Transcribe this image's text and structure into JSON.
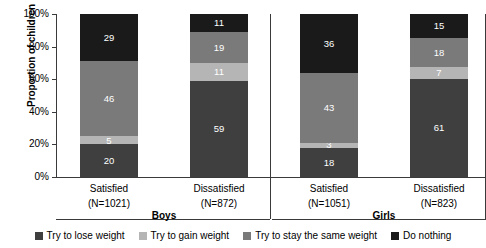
{
  "chart_data": {
    "type": "bar",
    "subtype": "stacked-percent",
    "title": "",
    "xlabel": "",
    "ylabel": "Proportion of children",
    "ylim": [
      0,
      100
    ],
    "ytick_labels": [
      "0%",
      "20%",
      "40%",
      "60%",
      "80%",
      "100%"
    ],
    "ytick_values": [
      0,
      20,
      40,
      60,
      80,
      100
    ],
    "grid": false,
    "legend_position": "bottom",
    "panels": [
      {
        "group": "Boys",
        "categories": [
          "Satisfied",
          "Dissatisfied"
        ],
        "category_notes": [
          "(N=1021)",
          "(N=872)"
        ]
      },
      {
        "group": "Girls",
        "categories": [
          "Satisfied",
          "Dissatisfied"
        ],
        "category_notes": [
          "(N=1051)",
          "(N=823)"
        ]
      }
    ],
    "categories": [
      "Boys Satisfied (N=1021)",
      "Boys Dissatisfied (N=872)",
      "Girls Satisfied (N=1051)",
      "Girls Dissatisfied (N=823)"
    ],
    "series": [
      {
        "name": "Try to lose weight",
        "color": "#3f3f3f",
        "values": [
          20,
          59,
          18,
          61
        ]
      },
      {
        "name": "Try to gain weight",
        "color": "#b5b5b5",
        "values": [
          5,
          11,
          3,
          7
        ]
      },
      {
        "name": "Try to stay the same weight",
        "color": "#7a7a7a",
        "values": [
          46,
          19,
          43,
          18
        ]
      },
      {
        "name": "Do nothing",
        "color": "#1a1a1a",
        "values": [
          29,
          11,
          36,
          15
        ]
      }
    ]
  },
  "axis": {
    "y_title": "Proportion of children"
  },
  "legend": {
    "items": [
      {
        "label": "Try to lose weight",
        "color": "#3f3f3f"
      },
      {
        "label": "Try to gain weight",
        "color": "#b5b5b5"
      },
      {
        "label": "Try to stay the same weight",
        "color": "#7a7a7a"
      },
      {
        "label": "Do nothing",
        "color": "#1a1a1a"
      }
    ]
  }
}
